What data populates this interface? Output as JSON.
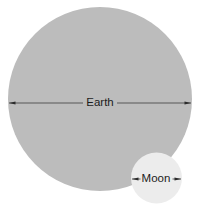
{
  "diagram": {
    "background_color": "#ffffff",
    "width": 206,
    "height": 208
  },
  "bodies": [
    {
      "key": "earth",
      "label": "Earth",
      "fill_color": "#bcbcbc",
      "center_x": 100,
      "center_y": 99,
      "radius": 92,
      "label_x": 100,
      "label_y": 103
    },
    {
      "key": "moon",
      "label": "Moon",
      "fill_color": "#ececec",
      "center_x": 156.5,
      "center_y": 178,
      "radius": 25.5,
      "label_x": 156,
      "label_y": 179
    }
  ],
  "measures": [
    {
      "key": "earth-diameter",
      "label": "Earth",
      "y": 103,
      "x_start": 9,
      "x_end": 191,
      "label_half_width": 17,
      "line_color": "#2b2b2b"
    },
    {
      "key": "moon-diameter",
      "label": "Moon",
      "y": 179,
      "x_start": 132,
      "x_end": 181,
      "label_half_width": 16,
      "line_color": "#2b2b2b"
    }
  ],
  "colors": {
    "earth_fill": "#bcbcbc",
    "moon_fill": "#ececec",
    "line": "#2b2b2b",
    "text": "#1c1c1c",
    "background": "#ffffff"
  }
}
